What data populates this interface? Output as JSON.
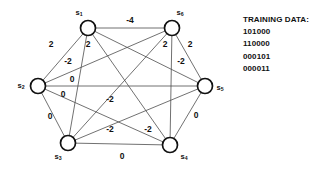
{
  "diagram": {
    "type": "weighted-complete-graph",
    "node_count": 6,
    "nodes": [
      {
        "id": "s1",
        "label": "s",
        "sub": "1",
        "x": 88,
        "y": 28,
        "r": 7.5,
        "label_x": 79,
        "label_y": 13
      },
      {
        "id": "s2",
        "label": "s",
        "sub": "2",
        "x": 38,
        "y": 86,
        "r": 7.5,
        "label_x": 21,
        "label_y": 86
      },
      {
        "id": "s3",
        "label": "s",
        "sub": "3",
        "x": 68,
        "y": 143,
        "r": 7.5,
        "label_x": 58,
        "label_y": 157
      },
      {
        "id": "s4",
        "label": "s",
        "sub": "4",
        "x": 170,
        "y": 145,
        "r": 7.5,
        "label_x": 184,
        "label_y": 157
      },
      {
        "id": "s5",
        "label": "s",
        "sub": "5",
        "x": 205,
        "y": 86,
        "r": 7.5,
        "label_x": 220,
        "label_y": 88
      },
      {
        "id": "s6",
        "label": "s",
        "sub": "6",
        "x": 172,
        "y": 28,
        "r": 7.5,
        "label_x": 180,
        "label_y": 13
      }
    ],
    "edges": [
      {
        "from": "s1",
        "to": "s6",
        "weight": "-4",
        "lx": 130,
        "ly": 21
      },
      {
        "from": "s1",
        "to": "s2",
        "weight": "2",
        "lx": 51,
        "ly": 45
      },
      {
        "from": "s1",
        "to": "s3",
        "weight": "2",
        "lx": 88,
        "ly": 45
      },
      {
        "from": "s2",
        "to": "s6",
        "weight": "-2",
        "lx": 68,
        "ly": 62
      },
      {
        "from": "s2",
        "to": "s5",
        "weight": "0",
        "lx": 72,
        "ly": 80
      },
      {
        "from": "s2",
        "to": "s4",
        "weight": "0",
        "lx": 63,
        "ly": 95
      },
      {
        "from": "s2",
        "to": "s3",
        "weight": "0",
        "lx": 50,
        "ly": 117
      },
      {
        "from": "s6",
        "to": "s4",
        "weight": "2",
        "lx": 165,
        "ly": 45
      },
      {
        "from": "s6",
        "to": "s5",
        "weight": "2",
        "lx": 190,
        "ly": 45
      },
      {
        "from": "s1",
        "to": "s5",
        "weight": "-2",
        "lx": 181,
        "ly": 62
      },
      {
        "from": "s1",
        "to": "s4",
        "weight": "-2",
        "lx": 110,
        "ly": 100
      },
      {
        "from": "s6",
        "to": "s3",
        "weight": "-2",
        "lx": 110,
        "ly": 130
      },
      {
        "from": "s3",
        "to": "s5",
        "weight": "-2",
        "lx": 148,
        "ly": 130
      },
      {
        "from": "s4",
        "to": "s5",
        "weight": "0",
        "lx": 196,
        "ly": 116
      },
      {
        "from": "s3",
        "to": "s4",
        "weight": "0",
        "lx": 122,
        "ly": 157
      }
    ],
    "colors": {
      "edge": "#4d4d4d",
      "node_stroke": "#111111",
      "node_fill": "#ffffff",
      "text": "#111111",
      "background": "#ffffff"
    }
  },
  "training_data": {
    "heading": "TRAINING DATA:",
    "patterns": [
      "101000",
      "110000",
      "000101",
      "000011"
    ]
  }
}
